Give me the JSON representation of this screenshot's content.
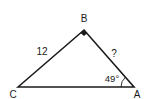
{
  "diagram": {
    "type": "right-triangle",
    "vertices": {
      "A": {
        "label": "A"
      },
      "B": {
        "label": "B",
        "right_angle": true
      },
      "C": {
        "label": "C"
      }
    },
    "sides": {
      "CB": {
        "label": "12"
      },
      "BA": {
        "label": "?"
      }
    },
    "angles": {
      "A": {
        "label": "49°"
      }
    },
    "colors": {
      "stroke": "#1a1a1a",
      "background": "#ffffff"
    }
  }
}
